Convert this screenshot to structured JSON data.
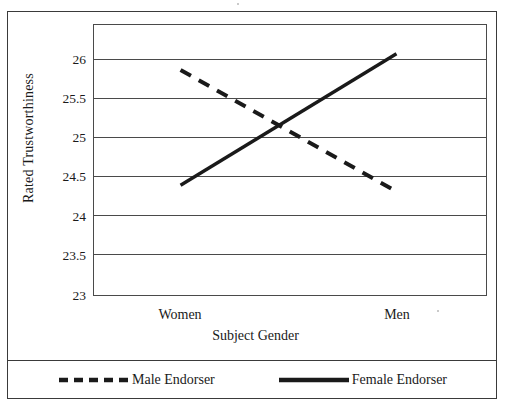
{
  "chart_data": {
    "type": "line",
    "title": "",
    "xlabel": "Subject Gender",
    "ylabel": "Rated Trustworthiness",
    "categories": [
      "Women",
      "Men"
    ],
    "ylim": [
      23,
      26
    ],
    "yticks": [
      "23",
      "23.5",
      "24",
      "24.5",
      "25",
      "25.5",
      "26"
    ],
    "ytick_values": [
      23,
      23.5,
      24,
      24.5,
      25,
      25.5,
      26
    ],
    "grid": true,
    "legend_position": "bottom",
    "series": [
      {
        "name": "Male Endorser",
        "style": "dashed",
        "color": "#1a1a1a",
        "values": [
          25.5,
          24.15
        ]
      },
      {
        "name": "Female Endorser",
        "style": "solid",
        "color": "#1a1a1a",
        "values": [
          24.22,
          25.68
        ]
      }
    ]
  },
  "axis": {
    "y_title": "Rated Trustworthiness",
    "x_title": "Subject Gender",
    "y_ticks": [
      {
        "label": "26"
      },
      {
        "label": "25.5"
      },
      {
        "label": "25"
      },
      {
        "label": "24.5"
      },
      {
        "label": "24"
      },
      {
        "label": "23.5"
      },
      {
        "label": "23"
      }
    ],
    "x_ticks": [
      {
        "label": "Women"
      },
      {
        "label": "Men"
      }
    ]
  },
  "legend": {
    "items": [
      {
        "label": "Male Endorser",
        "style": "dashed"
      },
      {
        "label": "Female Endorser",
        "style": "solid"
      }
    ]
  }
}
